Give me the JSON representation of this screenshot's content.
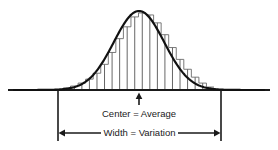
{
  "figure": {
    "background_color": "#ffffff",
    "line_color": "#1a1a1a",
    "bar_color": "#555555",
    "text_color": "#1a1a1a"
  },
  "labels": {
    "center_label": "Center = Average",
    "width_label": "Width = Variation"
  },
  "annotations": {
    "center_arrow": "up-arrow-icon",
    "width_arrow_left": "left-arrowhead-icon",
    "width_arrow_right": "right-arrowhead-icon"
  },
  "chart_data": {
    "type": "area",
    "title": "",
    "xlabel": "",
    "ylabel": "",
    "grid": false,
    "legend": false,
    "curve_name": "normal-distribution-bell-curve",
    "baseline_y": 90,
    "peak_x": 139,
    "peak_y": 11,
    "bracket_left_x": 58,
    "bracket_right_x": 221,
    "bracket_bottom_y": 140,
    "categories": [
      1,
      2,
      3,
      4,
      5,
      6,
      7,
      8,
      9,
      10,
      11,
      12,
      13,
      14,
      15,
      16,
      17,
      18,
      19,
      20
    ],
    "values": [
      2,
      4,
      7,
      11,
      17,
      26,
      38,
      52,
      64,
      74,
      78,
      76,
      68,
      56,
      43,
      31,
      21,
      13,
      7,
      3
    ],
    "ylim": [
      0,
      80
    ],
    "bar_x_start": 63,
    "bar_x_end": 214
  }
}
